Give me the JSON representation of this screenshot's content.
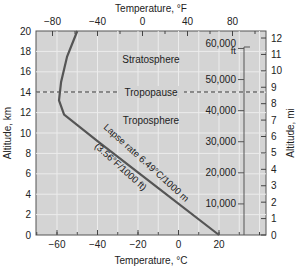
{
  "chart_data": {
    "type": "line",
    "title": "",
    "top_xlabel": "Temperature, °F",
    "xlabel": "Temperature, °C",
    "ylabel": "Altitude, km",
    "right_ylabel": "Altitude, mi",
    "xlim_c": [
      -70.6,
      43
    ],
    "ylim_km": [
      0,
      20
    ],
    "x_ticks_c": [
      "-60",
      "-40",
      "-20",
      "0",
      "20"
    ],
    "x_ticks_f": [
      "-80",
      "-40",
      "0",
      "40",
      "80"
    ],
    "y_ticks_km": [
      "0",
      "2",
      "4",
      "6",
      "8",
      "10",
      "12",
      "14",
      "16",
      "18",
      "20"
    ],
    "y_ticks_mi": [
      "0",
      "1",
      "2",
      "3",
      "4",
      "5",
      "6",
      "7",
      "8",
      "9",
      "10",
      "11",
      "12"
    ],
    "ft_ticks": [
      "10,000",
      "20,000",
      "30,000",
      "40,000",
      "50,000",
      "60,000"
    ],
    "ft_unit": "ft",
    "grid": true,
    "series": [
      {
        "name": "Temperature profile",
        "x_c": [
          20,
          -10,
          -40,
          -56.5,
          -59,
          -58,
          -55,
          -50
        ],
        "y_km": [
          0,
          4.6,
          9.2,
          11.8,
          13.2,
          15,
          17.5,
          20
        ]
      }
    ],
    "annotations": {
      "stratosphere": "Stratosphere",
      "tropopause": "Tropopause",
      "troposphere": "Troposphere",
      "lapse_rate": "Lapse rate 6.49°C/1000 m",
      "lapse_rate_f": "(3.56°F/1000 ft)",
      "tropopause_km": 14
    }
  }
}
